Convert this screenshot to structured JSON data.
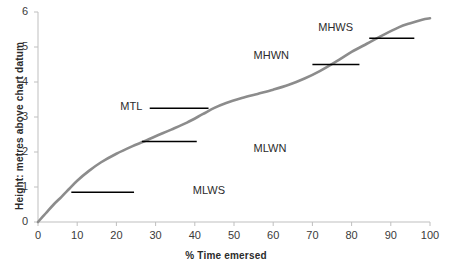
{
  "chart_data": {
    "type": "line",
    "title": "",
    "xlabel": "% Time emersed",
    "ylabel": "Height: metres above chart datum",
    "xlim": [
      0,
      100
    ],
    "ylim": [
      0,
      6
    ],
    "xticks": [
      0,
      10,
      20,
      30,
      40,
      50,
      60,
      70,
      80,
      90,
      100
    ],
    "xtick_labels": [
      "0",
      "10",
      "20",
      "30",
      "40",
      "50",
      "60",
      "70",
      "80",
      "90",
      "100"
    ],
    "yticks": [
      0,
      1,
      2,
      3,
      4,
      5,
      6
    ],
    "ytick_labels": [
      "0",
      "1",
      "2",
      "3",
      "4",
      "5",
      "6"
    ],
    "grid": false,
    "legend": "none",
    "series": [
      {
        "name": "tidal-exposure-curve",
        "color": "#8c8c8c",
        "x": [
          0,
          2,
          4,
          6,
          8,
          10,
          13,
          16,
          20,
          24,
          27,
          30,
          34,
          38,
          42,
          45,
          48,
          52,
          56,
          60,
          64,
          68,
          72,
          76,
          80,
          84,
          88,
          92,
          95,
          98,
          100
        ],
        "y": [
          0.0,
          0.25,
          0.5,
          0.72,
          0.95,
          1.18,
          1.46,
          1.7,
          1.95,
          2.16,
          2.3,
          2.45,
          2.64,
          2.84,
          3.08,
          3.26,
          3.4,
          3.54,
          3.66,
          3.78,
          3.92,
          4.1,
          4.32,
          4.58,
          4.86,
          5.1,
          5.34,
          5.56,
          5.68,
          5.78,
          5.82
        ]
      }
    ],
    "markers": [
      {
        "name": "MLWS",
        "label": "MLWS",
        "level": 0.85,
        "x_start": 8.5,
        "x_end": 24.5,
        "label_x": 39.5,
        "label_y": 0.85,
        "color": "#000000"
      },
      {
        "name": "MLWN",
        "label": "MLWN",
        "level": 2.3,
        "x_start": 26.5,
        "x_end": 40.5,
        "label_x": 55.0,
        "label_y": 2.05,
        "color": "#000000"
      },
      {
        "name": "MTL",
        "label": "MTL",
        "level": 3.25,
        "x_start": 28.5,
        "x_end": 43.5,
        "label_x": 21.0,
        "label_y": 3.25,
        "color": "#000000"
      },
      {
        "name": "MHWN",
        "label": "MHWN",
        "level": 4.5,
        "x_start": 70.0,
        "x_end": 82.0,
        "label_x": 55.0,
        "label_y": 4.72,
        "color": "#000000"
      },
      {
        "name": "MHWS",
        "label": "MHWS",
        "level": 5.25,
        "x_start": 84.5,
        "x_end": 96.0,
        "label_x": 71.5,
        "label_y": 5.52,
        "color": "#000000"
      }
    ],
    "axis_color": "#bfbfbf",
    "curve_color": "#8c8c8c",
    "marker_color": "#000000"
  }
}
